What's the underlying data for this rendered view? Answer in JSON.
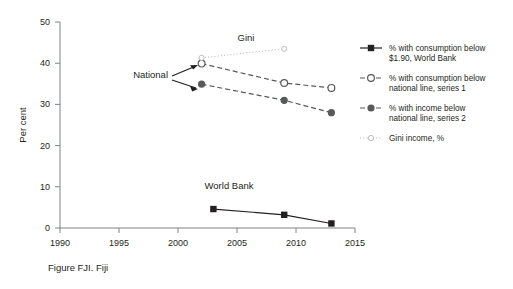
{
  "caption": "Figure FJI. Fiji",
  "axes": {
    "ylabel": "Per cent",
    "yticks": [
      "0",
      "10",
      "20",
      "30",
      "40",
      "50"
    ],
    "xticks": [
      "1990",
      "1995",
      "2000",
      "2005",
      "2010",
      "2015"
    ]
  },
  "annotations": {
    "gini": "Gini",
    "national": "National",
    "world_bank": "World Bank"
  },
  "legend": {
    "items": [
      {
        "line1": "% with consumption below",
        "line2": "$1.90, World Bank",
        "marker": "filled-square-icon",
        "color": "#231f20"
      },
      {
        "line1": "% with consumption below",
        "line2": "national line, series 1",
        "marker": "open-circle-icon",
        "color": "#58595b"
      },
      {
        "line1": "% with income below",
        "line2": "national line, series 2",
        "marker": "filled-circle-icon",
        "color": "#58595b"
      },
      {
        "line1": "Gini income, %",
        "line2": "",
        "marker": "small-open-circle-icon",
        "color": "#bcbec0"
      }
    ]
  },
  "chart_data": {
    "type": "line",
    "title": "Figure FJI. Fiji",
    "xlabel": "",
    "ylabel": "Per cent",
    "xlim": [
      1988,
      2017
    ],
    "ylim": [
      0,
      50
    ],
    "xticks": [
      1990,
      1995,
      2000,
      2005,
      2010,
      2015
    ],
    "yticks": [
      0,
      10,
      20,
      30,
      40,
      50
    ],
    "grid": false,
    "legend_position": "right",
    "series": [
      {
        "name": "% with consumption below $1.90, World Bank",
        "marker": "filled-square",
        "linestyle": "solid",
        "color": "#231f20",
        "x": [
          2003,
          2009,
          2013
        ],
        "y": [
          4.6,
          3.2,
          1.1
        ]
      },
      {
        "name": "% with consumption below national line, series 1",
        "marker": "open-circle",
        "linestyle": "dashed",
        "color": "#58595b",
        "x": [
          2002,
          2009,
          2013
        ],
        "y": [
          39.9,
          35.2,
          34.0
        ]
      },
      {
        "name": "% with income below national line, series 2",
        "marker": "filled-circle",
        "linestyle": "dashed",
        "color": "#58595b",
        "x": [
          2002,
          2009,
          2013
        ],
        "y": [
          34.9,
          31.0,
          28.0
        ]
      },
      {
        "name": "Gini income, %",
        "marker": "small-open-circle",
        "linestyle": "dotted",
        "color": "#bcbec0",
        "x": [
          2002,
          2009
        ],
        "y": [
          41.3,
          43.5
        ]
      }
    ],
    "annotations": [
      {
        "text": "Gini",
        "x": 2009,
        "y": 46.5
      },
      {
        "text": "National",
        "x": 1998,
        "y": 37.0
      },
      {
        "text": "World Bank",
        "x": 2005.5,
        "y": 9.0
      }
    ]
  }
}
